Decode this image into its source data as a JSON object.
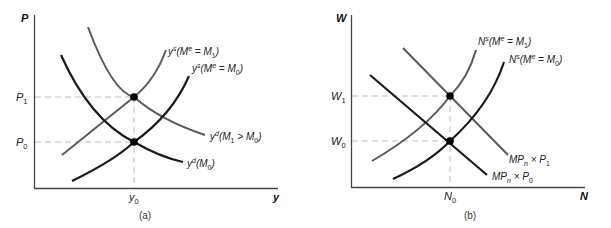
{
  "colors": {
    "dark_curve": "#1a1a1a",
    "light_curve": "#5a5a5a",
    "axis": "#444444",
    "guide": "#bdbdbd",
    "point": "#000000"
  },
  "panel_a": {
    "caption": "(a)",
    "y_axis_label": "P",
    "x_axis_label": "y",
    "tick_p1": {
      "main": "P",
      "sub": "1"
    },
    "tick_p0": {
      "main": "P",
      "sub": "0"
    },
    "tick_y0": {
      "main": "y",
      "sub": "0"
    },
    "curves": {
      "ys_m1": {
        "pre": "y",
        "sup": "s",
        "mid": "(M",
        "sup2": "e",
        "mid2": " = M",
        "sub": "1",
        "post": ")"
      },
      "ys_m0": {
        "pre": "y",
        "sup": "s",
        "mid": "(M",
        "sup2": "e",
        "mid2": " = M",
        "sub": "0",
        "post": ")"
      },
      "yd_m1": {
        "pre": "y",
        "sup": "d",
        "mid": "(M",
        "sub": "1",
        "mid2": " > M",
        "sub2": "0",
        "post": ")"
      },
      "yd_m0": {
        "pre": "y",
        "sup": "d",
        "mid": "(M",
        "sub": "0",
        "post": ")"
      }
    }
  },
  "panel_b": {
    "caption": "(b)",
    "y_axis_label": "W",
    "x_axis_label": "N",
    "tick_w1": {
      "main": "W",
      "sub": "1"
    },
    "tick_w0": {
      "main": "W",
      "sub": "0"
    },
    "tick_n0": {
      "main": "N",
      "sub": "0"
    },
    "curves": {
      "ns_m1": {
        "pre": "N",
        "sup": "s",
        "mid": "(M",
        "sup2": "e",
        "mid2": " = M",
        "sub": "1",
        "post": ")"
      },
      "ns_m0": {
        "pre": "N",
        "sup": "s",
        "mid": "(M",
        "sup2": "e",
        "mid2": " = M",
        "sub": "0",
        "post": ")"
      },
      "mpn_p1": {
        "pre": "MP",
        "sub": "n",
        "mid": " × P",
        "sub2": "1"
      },
      "mpn_p0": {
        "pre": "MP",
        "sub": "n",
        "mid": " × P",
        "sub2": "0"
      }
    }
  }
}
